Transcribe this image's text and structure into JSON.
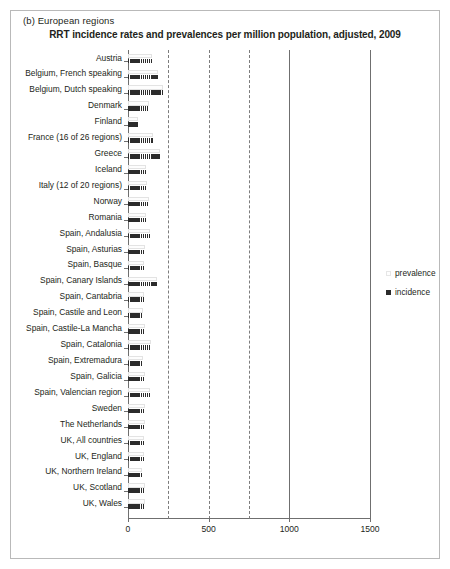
{
  "panel": {
    "label": "(b)  European regions",
    "title": "RRT incidence rates and prevalences per million population, adjusted, 2009"
  },
  "legend": {
    "items": [
      {
        "label": "prevalence",
        "marker": "light-square-swatch",
        "color": "#fefefe"
      },
      {
        "label": "incidence",
        "marker": "dark-square-swatch",
        "color": "#2b2b2b"
      }
    ]
  },
  "chart_data": {
    "type": "bar",
    "orientation": "horizontal",
    "title": "RRT incidence rates and prevalences per million population, adjusted, 2009",
    "xlabel": "",
    "ylabel": "",
    "xlim": [
      0,
      1500
    ],
    "xticks": [
      0,
      500,
      1000,
      1500
    ],
    "xticklabels": [
      "0",
      "500",
      "1000",
      "1500"
    ],
    "gridlines": [
      250,
      500,
      750,
      1000,
      1500
    ],
    "grid": true,
    "legend_position": "right",
    "categories": [
      "Austria",
      "Belgium, French speaking",
      "Belgium, Dutch speaking",
      "Denmark",
      "Finland",
      "France (16 of 26 regions)",
      "Greece",
      "Iceland",
      "Italy (12 of 20 regions)",
      "Norway",
      "Romania",
      "Spain, Andalusia",
      "Spain, Asturias",
      "Spain, Basque",
      "Spain, Canary Islands",
      "Spain, Cantabria",
      "Spain, Castile and Leon",
      "Spain, Castile-La Mancha",
      "Spain, Catalonia",
      "Spain, Extremadura",
      "Spain, Galicia",
      "Spain, Valencian region",
      "Sweden",
      "The Netherlands",
      "UK, All countries",
      "UK, England",
      "UK, Northern Ireland",
      "UK, Scotland",
      "UK, Wales"
    ],
    "series": [
      {
        "name": "prevalence",
        "values": [
          148,
          185,
          216,
          130,
          62,
          154,
          197,
          111,
          117,
          130,
          111,
          136,
          105,
          99,
          179,
          99,
          93,
          105,
          142,
          93,
          105,
          136,
          105,
          105,
          99,
          99,
          86,
          105,
          105
        ]
      },
      {
        "name": "incidence",
        "values": [
          148,
          185,
          216,
          130,
          62,
          154,
          197,
          111,
          117,
          130,
          111,
          136,
          105,
          99,
          179,
          99,
          93,
          105,
          142,
          93,
          105,
          136,
          105,
          105,
          99,
          99,
          86,
          105,
          105
        ]
      }
    ]
  }
}
